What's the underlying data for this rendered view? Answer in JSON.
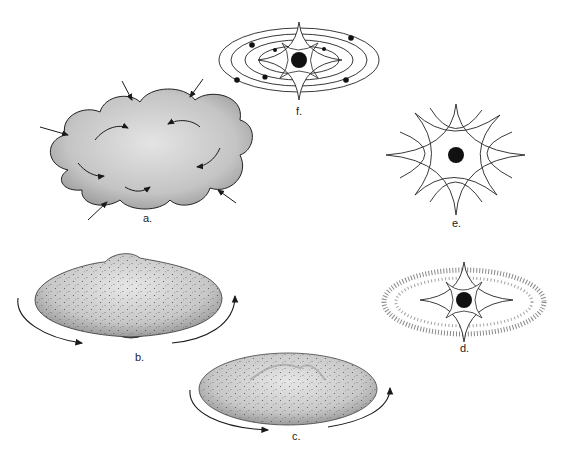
{
  "figure": {
    "panels": [
      {
        "id": "a",
        "label": "a.",
        "description": "Collapsing gas cloud with inflow and turbulent circulation arrows"
      },
      {
        "id": "b",
        "label": "b.",
        "description": "Rotating flattened cloud with central bulge"
      },
      {
        "id": "c",
        "label": "c.",
        "description": "Rotating protoplanetary disk"
      },
      {
        "id": "d",
        "label": "d.",
        "description": "Young star surrounded by dusty ring"
      },
      {
        "id": "e",
        "label": "e.",
        "description": "Bright young star with radiating spikes"
      },
      {
        "id": "f",
        "label": "f.",
        "description": "Star with orbiting planets on concentric elliptical orbits"
      }
    ]
  },
  "colors": {
    "background": "#ffffff",
    "ink": "#1a1a1a",
    "cloud_fill": "#c9c9c9",
    "disk_fill": "#bdbdbd"
  }
}
